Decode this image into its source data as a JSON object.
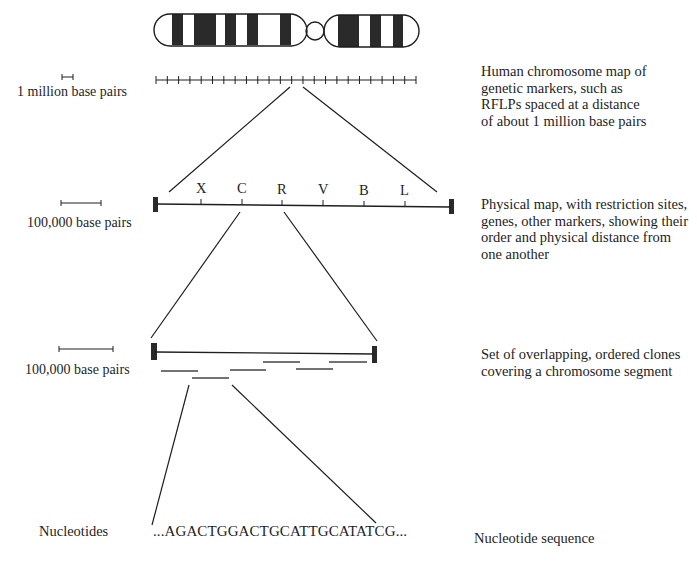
{
  "levels": [
    {
      "id": "chromosome-map",
      "scale_label": "1 million base pairs",
      "description": "Human chromosome map of\ngenetic markers, such as\nRFLPs spaced at a distance\nof about 1 million base pairs"
    },
    {
      "id": "physical-map",
      "scale_label": "100,000  base pairs",
      "markers": [
        "X",
        "C",
        "R",
        "V",
        "B",
        "L"
      ],
      "description": "Physical map, with restriction sites,\ngenes, other markers, showing their\norder and physical distance from\none another"
    },
    {
      "id": "clone-map",
      "scale_label": "100,000  base pairs",
      "description": "Set of overlapping, ordered clones\ncovering a chromosome segment"
    },
    {
      "id": "sequence",
      "left_label": "Nucleotides",
      "sequence": "...AGACTGGACTGCATTGCATATCG...",
      "description": "Nucleotide sequence"
    }
  ],
  "colors": {
    "ink": "#1e1e1e",
    "band": "#2a2a2a",
    "background": "#ffffff"
  }
}
